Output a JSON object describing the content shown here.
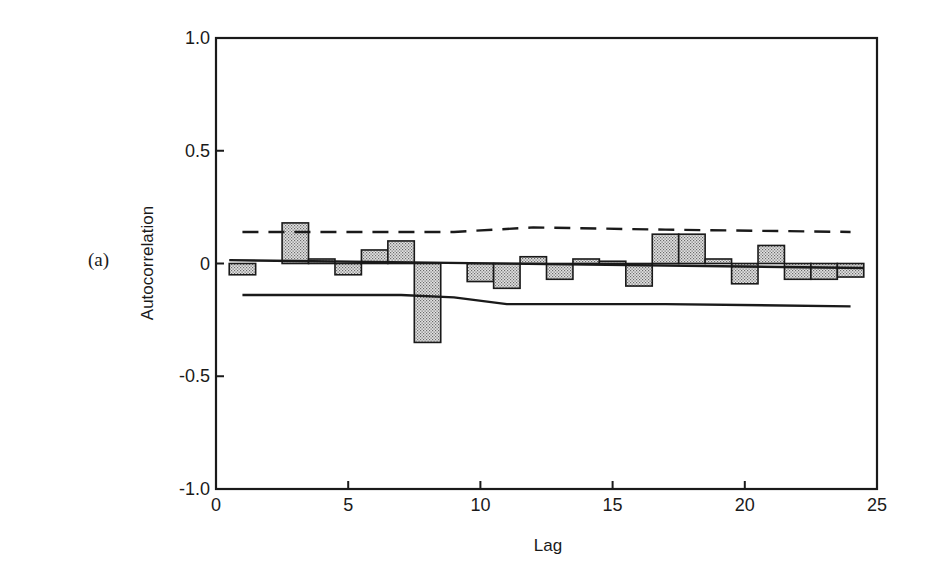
{
  "panel_label": "(a)",
  "chart_data": {
    "type": "bar",
    "title": "",
    "xlabel": "Lag",
    "ylabel": "Autocorrelation",
    "xlim": [
      0,
      25
    ],
    "ylim": [
      -1.0,
      1.0
    ],
    "xticks": [
      0,
      5,
      10,
      15,
      20,
      25
    ],
    "xtick_labels": [
      "0",
      "5",
      "10",
      "15",
      "20",
      "25"
    ],
    "yticks": [
      1.0,
      0.5,
      0,
      -0.5,
      -1.0
    ],
    "ytick_labels": [
      "1.0",
      "0.5",
      "0",
      "-0.5",
      "-1.0"
    ],
    "grid": false,
    "categories": [
      1,
      2,
      3,
      4,
      5,
      6,
      7,
      8,
      9,
      10,
      11,
      12,
      13,
      14,
      15,
      16,
      17,
      18,
      19,
      20,
      21,
      22,
      23,
      24
    ],
    "series": [
      {
        "name": "Autocorrelation",
        "values": [
          -0.05,
          0.0,
          0.18,
          0.02,
          -0.05,
          0.06,
          0.1,
          -0.35,
          0.0,
          -0.08,
          -0.11,
          0.03,
          -0.07,
          0.02,
          0.01,
          -0.1,
          0.13,
          0.13,
          0.02,
          -0.09,
          0.08,
          -0.07,
          -0.07,
          -0.06
        ]
      },
      {
        "name": "Upper confidence bound (dashed)",
        "style": "dashed",
        "x": [
          1,
          7,
          9,
          12,
          17,
          24
        ],
        "values": [
          0.14,
          0.14,
          0.14,
          0.16,
          0.15,
          0.14
        ]
      },
      {
        "name": "Lower confidence bound (solid)",
        "style": "solid",
        "x": [
          1,
          7,
          9,
          11,
          17,
          24
        ],
        "values": [
          -0.14,
          -0.14,
          -0.15,
          -0.18,
          -0.18,
          -0.19
        ]
      },
      {
        "name": "Trend line near zero (solid)",
        "style": "solid",
        "x": [
          0.5,
          24.5
        ],
        "values": [
          0.015,
          -0.02
        ]
      }
    ],
    "legend": null
  }
}
